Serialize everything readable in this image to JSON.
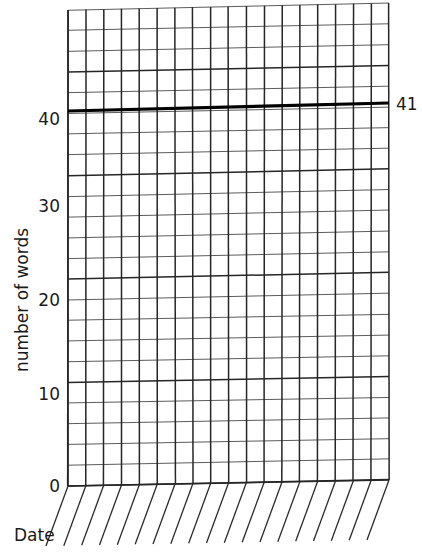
{
  "chart_data": {
    "type": "line",
    "title": "",
    "subtitle": "",
    "xlabel": "Date",
    "ylabel": "number of words",
    "ylim": [
      0,
      46
    ],
    "xlim": [
      0,
      18
    ],
    "grid": true,
    "legend": null,
    "y_ticks": [
      0,
      10,
      20,
      30,
      40
    ],
    "y_tick_labels": [
      "0",
      "10",
      "20",
      "30",
      "40"
    ],
    "y_minor_step": 2,
    "x_ticks": [
      0,
      1,
      2,
      3,
      4,
      5,
      6,
      7,
      8,
      9,
      10,
      11,
      12,
      13,
      14,
      15,
      16,
      17,
      18
    ],
    "x_tick_labels": [
      "",
      "",
      "",
      "",
      "",
      "",
      "",
      "",
      "",
      "",
      "",
      "",
      "",
      "",
      "",
      "",
      "",
      "",
      ""
    ],
    "x_columns": 18,
    "y_rows": 23,
    "series": [
      {
        "name": "goal line",
        "type": "line",
        "style": "bold",
        "color": "#000000",
        "annotation": "41",
        "values": [
          41,
          41,
          41,
          41,
          41,
          41,
          41,
          41,
          41,
          41,
          41,
          41,
          41,
          41,
          41,
          41,
          41,
          41,
          41
        ]
      }
    ],
    "annotations": [
      {
        "text": "41",
        "value": 41,
        "position": "right-of-axis"
      }
    ]
  },
  "axes": {
    "y_axis_title": "number of words",
    "x_axis_title": "Date",
    "y_labels": {
      "t0": "0",
      "t10": "10",
      "t20": "20",
      "t30": "30",
      "t40": "40"
    }
  },
  "labels": {
    "goal_value": "41"
  }
}
